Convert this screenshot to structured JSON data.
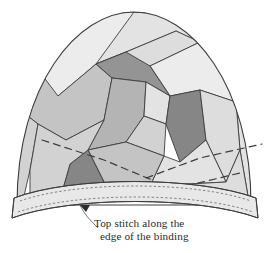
{
  "illustration": {
    "title": "Top stitching the binding on a pieced hat crown",
    "caption": {
      "line1": "Top stitch along the",
      "line2": "edge of the binding",
      "lines": [
        "Top stitch along the",
        "edge of the binding"
      ]
    },
    "labels": {
      "dome": "pieced-crown-dome",
      "binding": "binding-band",
      "arrow": "caption-arrow"
    }
  },
  "colors": {
    "background": "#ffffff",
    "outline": "#3d3d3d",
    "stitch": "#6a6a6a",
    "caption_text": "#2b2b2b",
    "leader": "#555555",
    "tone_lightest": "#ececed",
    "tone_light": "#e3e3e4",
    "tone_pale": "#dddddd",
    "tone_mid_light": "#d2d2d3",
    "tone_mid": "#c4c4c5",
    "tone_mid_dark": "#b4b4b5",
    "tone_dark": "#a3a3a4",
    "tone_darker": "#949495",
    "tone_darkest": "#868687",
    "binding_fill": "#e8e8e8"
  },
  "shapes": {
    "dome_path": "M 17 205 C 17 85 77 12 134 12 C 191 12 251 85 251 205 Z",
    "patches": [
      {
        "name": "patch-top-left-sky",
        "tone": "tone_lightest",
        "points": "26 150 20 110 36 67 66 33 102 14 134 12 160 14 96 64 58 96"
      },
      {
        "name": "patch-top-right-band",
        "tone": "tone_light",
        "points": "160 14 134 12 96 64 126 52 176 31 216 50 246 124 242 86 216 44 186 22"
      },
      {
        "name": "patch-top-wedge",
        "tone": "tone_pale",
        "points": "176 31 126 52 96 64 112 78 150 66 200 42"
      },
      {
        "name": "patch-right-upper",
        "tone": "tone_lightest",
        "points": "200 42 150 66 170 96 200 90 236 102 246 124 216 50"
      },
      {
        "name": "patch-right-edge",
        "tone": "tone_light",
        "points": "246 124 236 102 240 150 248 196 251 205 250 160"
      },
      {
        "name": "patch-left-upper",
        "tone": "tone_mid",
        "points": "58 96 96 64 112 78 104 120 66 140 38 124 20 110 36 67"
      },
      {
        "name": "patch-left-mid",
        "tone": "tone_mid_light",
        "points": "20 110 38 124 30 170 24 196 17 205 17 150"
      },
      {
        "name": "patch-center-top",
        "tone": "tone_darker",
        "points": "112 78 96 64 126 52 150 66 170 96 146 82"
      },
      {
        "name": "patch-center-upper",
        "tone": "tone_mid_dark",
        "points": "104 120 112 78 146 82 144 116 126 142 88 150"
      },
      {
        "name": "patch-center-inner",
        "tone": "tone_light",
        "points": "146 82 170 96 166 124 144 116"
      },
      {
        "name": "patch-center-core",
        "tone": "tone_mid_light",
        "points": "144 116 166 124 164 156 126 142"
      },
      {
        "name": "patch-right-dark",
        "tone": "tone_darkest",
        "points": "170 96 200 90 206 140 180 162 166 124"
      },
      {
        "name": "patch-right-lower",
        "tone": "tone_pale",
        "points": "200 90 236 102 240 150 226 182 206 140"
      },
      {
        "name": "patch-bottom-right",
        "tone": "tone_light",
        "points": "206 140 226 182 150 186 164 156 180 162"
      },
      {
        "name": "patch-bottom-center",
        "tone": "tone_mid",
        "points": "126 142 164 156 150 186 108 190 88 150"
      },
      {
        "name": "patch-bottom-dark",
        "tone": "tone_darkest",
        "points": "88 150 108 190 62 192 70 164"
      },
      {
        "name": "patch-bottom-left",
        "tone": "tone_mid_light",
        "points": "66 140 104 120 88 150 70 164 62 192 30 194 30 170 38 124"
      },
      {
        "name": "patch-lower-left-pale",
        "tone": "tone_pale",
        "points": "30 194 62 192 108 190 150 186 226 182 240 150 248 196 24 196"
      }
    ],
    "construction_lines": [
      {
        "name": "dash-left-to-center",
        "d": "M 42 140 L 104 160 L 152 180"
      },
      {
        "name": "dash-center-to-right",
        "d": "M 146 178 L 200 158 L 262 144"
      },
      {
        "name": "dash-right-lower",
        "d": "M 186 186 L 244 172"
      }
    ],
    "binding": {
      "top_edge": "M 14 198 C 72 176 196 176 256 198",
      "bottom_edge": "M 12 218 C 72 196 198 196 258 218",
      "left_cap": "M 14 198 L 12 218",
      "right_cap": "M 256 198 L 258 218",
      "fill": "M 14 198 C 72 176 196 176 256 198 L 258 218 C 198 196 72 196 12 218 Z",
      "stitch_upper": "M 20 201 C 76 181 194 181 251 201",
      "stitch_lower": "M 18 212 C 76 192 196 192 253 212"
    },
    "arrow": {
      "leader": "M 98 228 C 90 220 84 214 80 205",
      "head": "80 205 90 205 86 212"
    },
    "caption_position": {
      "x": 94,
      "y": 227,
      "line_height": 13
    }
  }
}
